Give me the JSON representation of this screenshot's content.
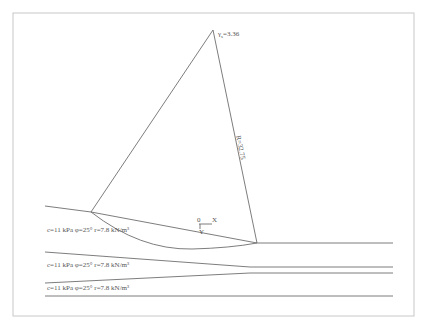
{
  "diagram": {
    "type": "slope-stability-circle",
    "safety_factor_label": "γ",
    "safety_factor_sub": "s",
    "safety_factor_value": "=3.36",
    "radius_label": "R=32.75",
    "origin_label": "0",
    "x_axis_label": "X",
    "y_axis_label": "Y",
    "layers": [
      {
        "label": "c=11 kPa  φ=25°  r=7.8 kN/m³"
      },
      {
        "label": "c=11 kPa  φ=25°  r=7.8 kN/m³"
      },
      {
        "label": "c=11 kPa  φ=25°  r=7.8 kN/m³"
      }
    ],
    "colors": {
      "line": "#6e6e6e",
      "frame": "#c8c8c8",
      "text": "#555555",
      "background": "#ffffff"
    }
  }
}
